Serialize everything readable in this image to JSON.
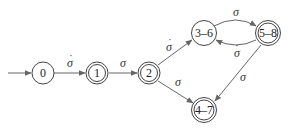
{
  "diagram": {
    "type": "finite-automaton",
    "colors": {
      "stroke": "#444444",
      "edge": "#666666",
      "text": "#222222",
      "background": "#ffffff"
    },
    "nodes": [
      {
        "id": "0",
        "label": "0",
        "accepting": false,
        "initial": true
      },
      {
        "id": "1",
        "label": "1",
        "accepting": true
      },
      {
        "id": "2",
        "label": "2",
        "accepting": true
      },
      {
        "id": "3-6",
        "label": "3–6",
        "accepting": false
      },
      {
        "id": "5-8",
        "label": "5–8",
        "accepting": true
      },
      {
        "id": "4-7",
        "label": "4–7",
        "accepting": true
      }
    ],
    "edges": [
      {
        "from": "0",
        "to": "1",
        "label": "σ",
        "dotted": true
      },
      {
        "from": "1",
        "to": "2",
        "label": "σ",
        "dotted": false
      },
      {
        "from": "2",
        "to": "3-6",
        "label": "σ",
        "dotted": true
      },
      {
        "from": "2",
        "to": "4-7",
        "label": "σ",
        "dotted": false
      },
      {
        "from": "3-6",
        "to": "5-8",
        "label": "σ",
        "dotted": false
      },
      {
        "from": "5-8",
        "to": "3-6",
        "label": "σ",
        "dotted": true
      },
      {
        "from": "5-8",
        "to": "4-7",
        "label": "σ",
        "dotted": false
      }
    ]
  }
}
